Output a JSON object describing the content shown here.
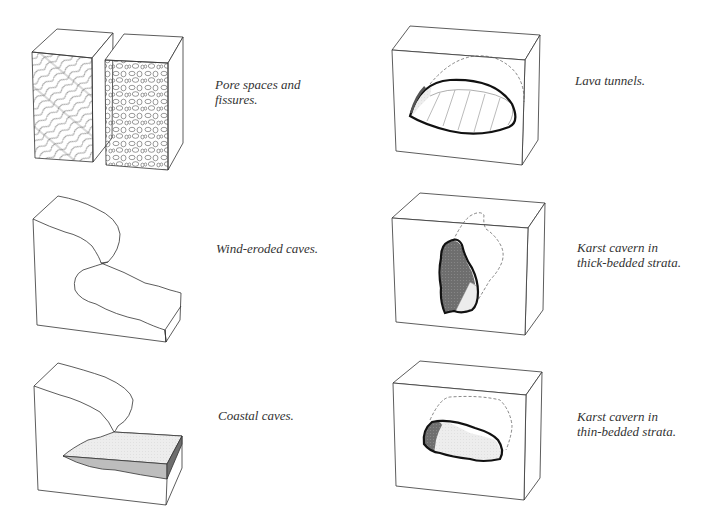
{
  "diagram": {
    "panels": [
      {
        "id": "pore-fissures",
        "caption": "Pore spaces and\nfissures.",
        "position": "row-1-left"
      },
      {
        "id": "lava-tunnels",
        "caption": "Lava tunnels.",
        "position": "row-1-right"
      },
      {
        "id": "wind-eroded",
        "caption": "Wind-eroded caves.",
        "position": "row-2-left"
      },
      {
        "id": "karst-thick",
        "caption": "Karst cavern in\nthick-bedded strata.",
        "position": "row-2-right"
      },
      {
        "id": "coastal",
        "caption": "Coastal caves.",
        "position": "row-3-left"
      },
      {
        "id": "karst-thin",
        "caption": "Karst cavern in\nthin-bedded strata.",
        "position": "row-3-right"
      }
    ],
    "colors": {
      "line": "#333333",
      "cave_outline": "#111111",
      "dark_fill": "#6b6b6b",
      "light_fill": "#ececec",
      "mid_fill": "#bdbdbd"
    }
  }
}
